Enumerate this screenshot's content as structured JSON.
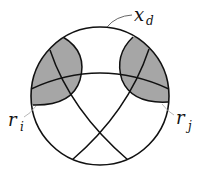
{
  "diagram": {
    "type": "circle-region-diagram",
    "colors": {
      "stroke": "#111111",
      "shade": "#a6a6a6",
      "leader": "#9a9a9a",
      "background": "#ffffff"
    },
    "labels": {
      "outer": {
        "base": "x",
        "sub": "d"
      },
      "left_region": {
        "base": "r",
        "sub": "i"
      },
      "right_region": {
        "base": "r",
        "sub": "j"
      }
    }
  }
}
